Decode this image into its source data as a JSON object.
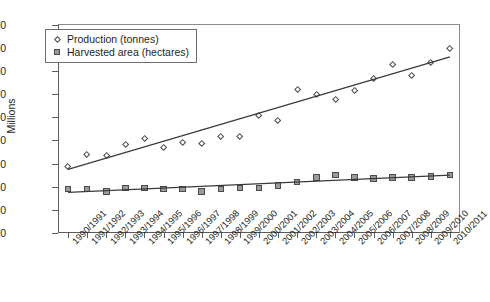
{
  "chart_data": {
    "type": "scatter",
    "title": "",
    "xlabel": "",
    "ylabel": "Millions",
    "ylim": [
      0,
      180
    ],
    "yticks": [
      0,
      20,
      40,
      60,
      80,
      100,
      120,
      140,
      160,
      180
    ],
    "grid": false,
    "legend_position": "top-left",
    "categories": [
      "1990/1991",
      "1991/1992",
      "1992/1993",
      "1993/1994",
      "1994/1995",
      "1995/1996",
      "1996/1997",
      "1997/1998",
      "1998/1999",
      "1999/2000",
      "2000/2001",
      "2001/2002",
      "2002/2003",
      "2003/2004",
      "2004/2005",
      "2005/2006",
      "2006/2007",
      "2007/2008",
      "2008/2009",
      "2009/2010",
      "2010/2011"
    ],
    "series": [
      {
        "name": "Production (tonnes)",
        "marker": "open-diamond",
        "trendline": true,
        "trend_start": 55,
        "trend_end": 152,
        "values": [
          57,
          68,
          67,
          76,
          81,
          74,
          78,
          77,
          83,
          83,
          101,
          97,
          124,
          119,
          115,
          123,
          133,
          145,
          136,
          147,
          159
        ]
      },
      {
        "name": "Harvested area (hectares)",
        "marker": "filled-square",
        "trendline": true,
        "trend_start": 35,
        "trend_end": 50,
        "values": [
          38,
          38,
          36,
          39,
          39,
          38,
          38,
          36,
          38,
          39,
          39,
          41,
          44,
          48,
          50,
          48,
          47,
          48,
          48,
          49,
          50
        ]
      }
    ]
  },
  "colors": {
    "axis": "#5b5b5b",
    "text": "#231f20",
    "marker_fill_area": "#9a9a9a",
    "marker_edge": "#4a4a4a",
    "trendline": "#3a3a3a"
  }
}
